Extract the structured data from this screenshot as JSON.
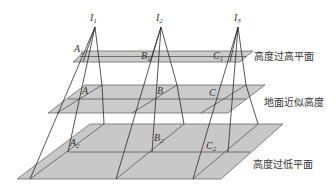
{
  "diagram": {
    "planes": [
      {
        "id": "high",
        "label": "高度过高平面"
      },
      {
        "id": "ground",
        "label": "地面近似高度"
      },
      {
        "id": "low",
        "label": "高度过低平面"
      }
    ],
    "cameras": [
      {
        "id": "I1",
        "base": "I",
        "sub": "1"
      },
      {
        "id": "I2",
        "base": "I",
        "sub": "2"
      },
      {
        "id": "I3",
        "base": "I",
        "sub": "3"
      }
    ],
    "points": {
      "high": [
        {
          "base": "A",
          "sub": "1"
        },
        {
          "base": "B",
          "sub": "1"
        },
        {
          "base": "C",
          "sub": "1"
        }
      ],
      "ground": [
        {
          "base": "A",
          "sub": ""
        },
        {
          "base": "B",
          "sub": ""
        },
        {
          "base": "C",
          "sub": ""
        }
      ],
      "low": [
        {
          "base": "A",
          "sub": "2"
        },
        {
          "base": "B",
          "sub": "2"
        },
        {
          "base": "C",
          "sub": "2"
        }
      ]
    }
  }
}
